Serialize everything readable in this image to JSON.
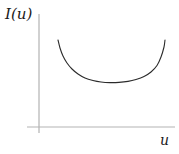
{
  "figure": {
    "background_color": "#ffffff",
    "width": 179,
    "height": 154
  },
  "axes": {
    "color": "#b3b3b3",
    "x_label": "u",
    "y_label": "I(u)",
    "origin": {
      "x": 39,
      "y": 127
    },
    "y_axis_top": 14,
    "x_axis_right": 175
  },
  "chart_data": {
    "type": "line",
    "title": "",
    "xlabel": "u",
    "ylabel": "I(u)",
    "grid": false,
    "legend": null,
    "axis_arrows": false,
    "curve_color": "#2b2b2b",
    "curve_width": 1.1,
    "xlim": [
      39,
      179
    ],
    "ylim": [
      127,
      14
    ],
    "series": [
      {
        "name": "I(u)",
        "points": [
          {
            "x": 58,
            "y": 40
          },
          {
            "x": 60,
            "y": 48
          },
          {
            "x": 63,
            "y": 56
          },
          {
            "x": 67,
            "y": 63
          },
          {
            "x": 72,
            "y": 69
          },
          {
            "x": 78,
            "y": 74
          },
          {
            "x": 85,
            "y": 78
          },
          {
            "x": 93,
            "y": 80.5
          },
          {
            "x": 101,
            "y": 82
          },
          {
            "x": 110,
            "y": 82.6
          },
          {
            "x": 119,
            "y": 82.4
          },
          {
            "x": 128,
            "y": 81.4
          },
          {
            "x": 136,
            "y": 79.5
          },
          {
            "x": 144,
            "y": 76.5
          },
          {
            "x": 151,
            "y": 72
          },
          {
            "x": 157,
            "y": 65.5
          },
          {
            "x": 161,
            "y": 57
          },
          {
            "x": 164,
            "y": 47
          },
          {
            "x": 165,
            "y": 40
          }
        ]
      }
    ]
  }
}
